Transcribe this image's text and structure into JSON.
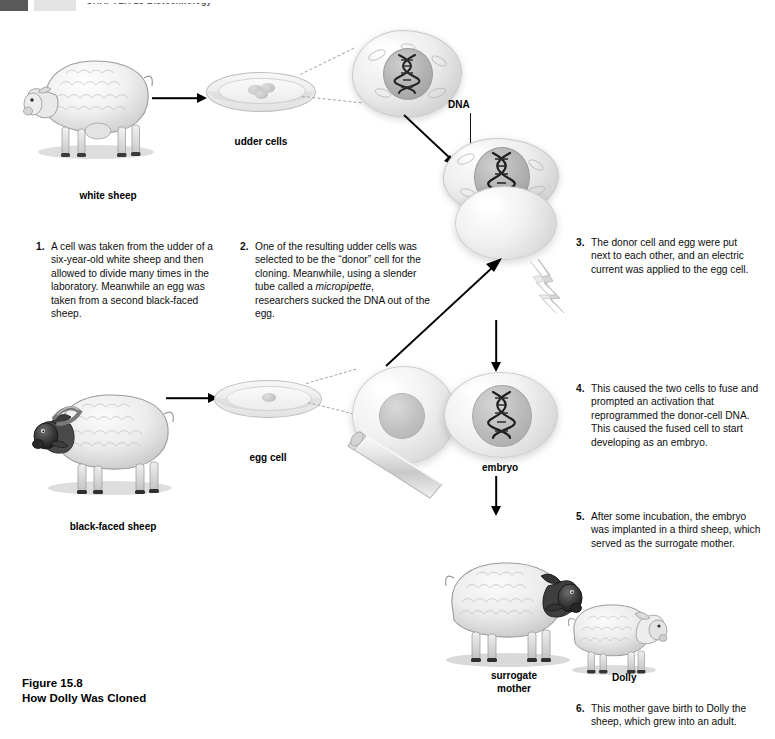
{
  "runhead": {
    "text": "CHAPTER 15   Biotechnology"
  },
  "figure": {
    "number": "Figure 15.8",
    "title": "How Dolly Was Cloned"
  },
  "labels": {
    "white_sheep": "white sheep",
    "udder_cells": "udder cells",
    "dna": "DNA",
    "black_faced_sheep": "black-faced sheep",
    "egg_cell": "egg cell",
    "embryo": "embryo",
    "surrogate_mother": "surrogate\nmother",
    "surrogate_mother_line1": "surrogate",
    "surrogate_mother_line2": "mother",
    "dolly": "Dolly"
  },
  "steps": [
    {
      "num": "1.",
      "text": "A cell was taken from the udder of a six-year-old white sheep and then allowed to divide many times in the laboratory. Meanwhile an egg was taken from a second black-faced sheep."
    },
    {
      "num": "2.",
      "text_pre": "One of the resulting udder cells was selected to be the “donor” cell for the cloning. Meanwhile, using a slender tube called a ",
      "text_italic": "micropipette",
      "text_post": ", researchers sucked the DNA out of the egg."
    },
    {
      "num": "3.",
      "text": "The donor cell and egg were put next to each other, and an electric current was applied to the egg cell."
    },
    {
      "num": "4.",
      "text": "This caused the two cells to fuse and prompted an activation that reprogrammed the donor-cell DNA. This caused the fused cell to start developing as an embryo."
    },
    {
      "num": "5.",
      "text": "After some incubation, the embryo was implanted in a third sheep, which served as the surrogate mother."
    },
    {
      "num": "6.",
      "text": "This mother gave birth to Dolly the sheep, which grew into an adult."
    }
  ],
  "colors": {
    "background": "#ffffff",
    "text": "#000000",
    "rule_gray": "#595959",
    "cell_gray": "#d2d2d2",
    "dna_dark": "#2a2a2a"
  },
  "diagram": {
    "type": "process-flow",
    "title": "How Dolly Was Cloned",
    "nodes": [
      "white sheep",
      "udder cells",
      "donor cell (DNA)",
      "black-faced sheep",
      "egg cell",
      "enucleated egg",
      "fused cell",
      "embryo",
      "surrogate mother",
      "Dolly"
    ]
  }
}
